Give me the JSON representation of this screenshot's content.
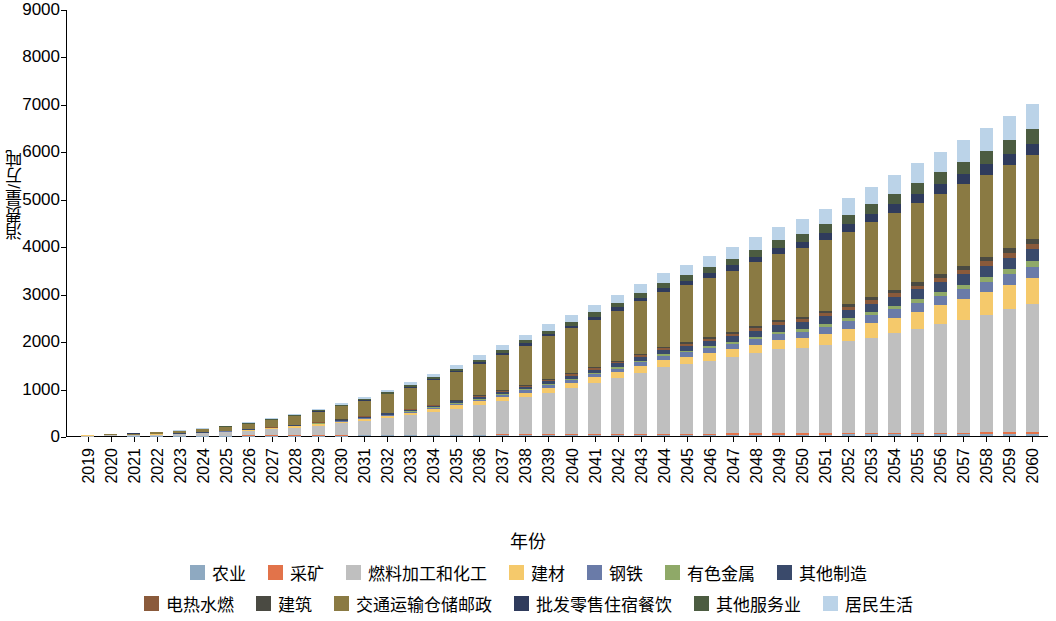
{
  "chart_data": {
    "type": "bar",
    "stacked": true,
    "title": "",
    "xlabel": "年份",
    "ylabel": "消费量/万吨",
    "ylim": [
      0,
      9000
    ],
    "yticks": [
      0,
      1000,
      2000,
      3000,
      4000,
      5000,
      6000,
      7000,
      8000,
      9000
    ],
    "grid": false,
    "legend_position": "bottom",
    "categories": [
      "2019",
      "2020",
      "2021",
      "2022",
      "2023",
      "2024",
      "2025",
      "2026",
      "2027",
      "2028",
      "2029",
      "2030",
      "2031",
      "2032",
      "2033",
      "2034",
      "2035",
      "2036",
      "2037",
      "2038",
      "2039",
      "2040",
      "2041",
      "2042",
      "2043",
      "2044",
      "2045",
      "2046",
      "2047",
      "2048",
      "2049",
      "2050",
      "2051",
      "2052",
      "2053",
      "2054",
      "2055",
      "2056",
      "2057",
      "2058",
      "2059",
      "2060"
    ],
    "series": [
      {
        "name": "农业",
        "color": "#8EA9C1",
        "values": [
          1,
          1,
          2,
          2,
          3,
          4,
          5,
          6,
          7,
          8,
          9,
          10,
          11,
          12,
          13,
          14,
          15,
          16,
          17,
          18,
          19,
          20,
          21,
          22,
          23,
          24,
          25,
          26,
          27,
          28,
          29,
          30,
          31,
          32,
          33,
          34,
          35,
          36,
          37,
          38,
          39,
          40
        ]
      },
      {
        "name": "采矿",
        "color": "#E2734A",
        "values": [
          1,
          1,
          2,
          2,
          3,
          4,
          5,
          6,
          7,
          8,
          9,
          10,
          11,
          12,
          13,
          14,
          15,
          16,
          17,
          18,
          19,
          20,
          21,
          22,
          23,
          24,
          25,
          26,
          27,
          28,
          29,
          30,
          31,
          32,
          33,
          34,
          35,
          36,
          37,
          38,
          39,
          40
        ]
      },
      {
        "name": "燃料加工和化工",
        "color": "#BFBFBF",
        "values": [
          8,
          12,
          18,
          25,
          35,
          50,
          70,
          95,
          125,
          160,
          200,
          245,
          295,
          350,
          410,
          475,
          545,
          620,
          700,
          785,
          875,
          970,
          1070,
          1175,
          1285,
          1400,
          1460,
          1530,
          1605,
          1685,
          1770,
          1800,
          1860,
          1930,
          2010,
          2095,
          2185,
          2280,
          2380,
          2485,
          2595,
          2710
        ]
      },
      {
        "name": "建材",
        "color": "#F5C96B",
        "values": [
          2,
          3,
          4,
          6,
          8,
          11,
          14,
          18,
          22,
          27,
          32,
          38,
          44,
          50,
          57,
          64,
          72,
          80,
          88,
          96,
          105,
          114,
          123,
          132,
          141,
          150,
          158,
          166,
          174,
          182,
          190,
          198,
          232,
          266,
          300,
          334,
          368,
          402,
          436,
          470,
          504,
          538
        ]
      },
      {
        "name": "钢铁",
        "color": "#6A7BA8",
        "values": [
          0,
          0,
          1,
          1,
          2,
          3,
          4,
          5,
          7,
          9,
          11,
          14,
          17,
          20,
          24,
          28,
          32,
          37,
          42,
          47,
          53,
          59,
          65,
          72,
          79,
          86,
          94,
          102,
          110,
          119,
          128,
          137,
          146,
          156,
          166,
          176,
          187,
          198,
          209,
          221,
          233,
          245
        ]
      },
      {
        "name": "有色金属",
        "color": "#8FA968",
        "values": [
          0,
          0,
          0,
          1,
          1,
          1,
          2,
          2,
          3,
          4,
          5,
          6,
          7,
          9,
          10,
          12,
          14,
          16,
          18,
          20,
          23,
          25,
          28,
          31,
          34,
          37,
          40,
          44,
          47,
          51,
          55,
          59,
          63,
          67,
          72,
          76,
          81,
          86,
          91,
          96,
          101,
          107
        ]
      },
      {
        "name": "其他制造",
        "color": "#3A4A6B",
        "values": [
          0,
          1,
          1,
          2,
          3,
          4,
          5,
          7,
          9,
          11,
          14,
          17,
          20,
          24,
          28,
          32,
          37,
          42,
          47,
          53,
          59,
          65,
          72,
          79,
          86,
          94,
          102,
          110,
          119,
          128,
          137,
          147,
          157,
          167,
          178,
          189,
          200,
          212,
          224,
          236,
          249,
          262
        ]
      },
      {
        "name": "电热水燃",
        "color": "#8A5A3B",
        "values": [
          0,
          0,
          1,
          1,
          1,
          2,
          2,
          3,
          4,
          5,
          6,
          7,
          8,
          10,
          11,
          13,
          15,
          17,
          19,
          21,
          24,
          26,
          29,
          32,
          35,
          38,
          41,
          45,
          48,
          52,
          56,
          60,
          64,
          68,
          73,
          77,
          82,
          87,
          92,
          97,
          102,
          108
        ]
      },
      {
        "name": "建筑",
        "color": "#4A4A42",
        "values": [
          0,
          0,
          0,
          1,
          1,
          1,
          2,
          2,
          3,
          4,
          5,
          6,
          7,
          8,
          10,
          11,
          13,
          15,
          17,
          19,
          21,
          23,
          26,
          28,
          31,
          34,
          37,
          40,
          43,
          46,
          50,
          53,
          57,
          61,
          65,
          69,
          73,
          78,
          82,
          87,
          92,
          97
        ]
      },
      {
        "name": "交通运输仓储邮政",
        "color": "#8A7A43",
        "values": [
          10,
          16,
          24,
          34,
          48,
          66,
          88,
          115,
          147,
          184,
          226,
          273,
          325,
          382,
          444,
          511,
          583,
          660,
          742,
          829,
          905,
          950,
          1000,
          1050,
          1100,
          1150,
          1200,
          1240,
          1290,
          1340,
          1390,
          1440,
          1490,
          1530,
          1580,
          1620,
          1660,
          1690,
          1720,
          1740,
          1760,
          1770
        ]
      },
      {
        "name": "批发零售住宿餐饮",
        "color": "#2F3B5C",
        "values": [
          0,
          0,
          1,
          1,
          2,
          3,
          4,
          5,
          7,
          9,
          11,
          14,
          17,
          20,
          24,
          28,
          32,
          37,
          42,
          47,
          53,
          59,
          65,
          72,
          79,
          86,
          94,
          102,
          110,
          119,
          128,
          137,
          147,
          157,
          167,
          178,
          189,
          200,
          212,
          224,
          236,
          249
        ]
      },
      {
        "name": "其他服务业",
        "color": "#4C5C41",
        "values": [
          0,
          1,
          1,
          2,
          3,
          4,
          6,
          8,
          10,
          13,
          16,
          20,
          24,
          28,
          33,
          38,
          44,
          50,
          56,
          63,
          70,
          78,
          86,
          94,
          103,
          112,
          122,
          132,
          142,
          153,
          164,
          176,
          188,
          200,
          213,
          226,
          240,
          254,
          268,
          283,
          298,
          313
        ]
      },
      {
        "name": "居民生活",
        "color": "#BBD3E8",
        "values": [
          1,
          2,
          3,
          5,
          7,
          10,
          13,
          17,
          22,
          27,
          33,
          40,
          47,
          55,
          64,
          73,
          83,
          94,
          105,
          117,
          130,
          143,
          157,
          171,
          186,
          202,
          218,
          235,
          252,
          270,
          289,
          308,
          328,
          348,
          369,
          390,
          412,
          435,
          458,
          482,
          506,
          531
        ]
      }
    ]
  },
  "legend": {
    "rows": [
      [
        {
          "label": "农业",
          "color": "#8EA9C1"
        },
        {
          "label": "采矿",
          "color": "#E2734A"
        },
        {
          "label": "燃料加工和化工",
          "color": "#BFBFBF"
        },
        {
          "label": "建材",
          "color": "#F5C96B"
        },
        {
          "label": "钢铁",
          "color": "#6A7BA8"
        },
        {
          "label": "有色金属",
          "color": "#8FA968"
        },
        {
          "label": "其他制造",
          "color": "#3A4A6B"
        }
      ],
      [
        {
          "label": "电热水燃",
          "color": "#8A5A3B"
        },
        {
          "label": "建筑",
          "color": "#4A4A42"
        },
        {
          "label": "交通运输仓储邮政",
          "color": "#8A7A43"
        },
        {
          "label": "批发零售住宿餐饮",
          "color": "#2F3B5C"
        },
        {
          "label": "其他服务业",
          "color": "#4C5C41"
        },
        {
          "label": "居民生活",
          "color": "#BBD3E8"
        }
      ]
    ]
  }
}
